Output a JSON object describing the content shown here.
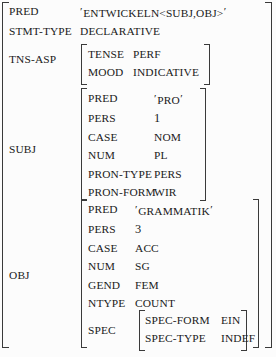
{
  "diagram": {
    "type": "lfg-f-structure",
    "title": "",
    "root": {
      "attributes": [
        {
          "attr": "PRED",
          "value": "ENTWICKELN<SUBJ,OBJ>",
          "quoted": true
        },
        {
          "attr": "STMT-TYPE",
          "value": "DECLARATIVE",
          "quoted": false
        },
        {
          "attr": "TNS-ASP",
          "value": "[embedded:tns-asp]",
          "quoted": false
        },
        {
          "attr": "SUBJ",
          "value": "[embedded:subj]",
          "quoted": false
        },
        {
          "attr": "OBJ",
          "value": "[embedded:obj]",
          "quoted": false
        }
      ]
    },
    "tns_asp": {
      "label": "TNS-ASP",
      "attributes": [
        {
          "attr": "TENSE",
          "value": "PERF"
        },
        {
          "attr": "MOOD",
          "value": "INDICATIVE"
        }
      ]
    },
    "subj": {
      "label": "SUBJ",
      "attributes": [
        {
          "attr": "PRED",
          "value": "PRO",
          "quoted": true
        },
        {
          "attr": "PERS",
          "value": "1",
          "quoted": false
        },
        {
          "attr": "CASE",
          "value": "NOM",
          "quoted": false
        },
        {
          "attr": "NUM",
          "value": "PL",
          "quoted": false
        },
        {
          "attr": "PRON-TYPE",
          "value": "PERS",
          "quoted": false
        },
        {
          "attr": "PRON-FORM",
          "value": "WIR",
          "quoted": false
        }
      ]
    },
    "obj": {
      "label": "OBJ",
      "attributes": [
        {
          "attr": "PRED",
          "value": "GRAMMATIK",
          "quoted": true
        },
        {
          "attr": "PERS",
          "value": "3",
          "quoted": false
        },
        {
          "attr": "CASE",
          "value": "ACC",
          "quoted": false
        },
        {
          "attr": "NUM",
          "value": "SG",
          "quoted": false
        },
        {
          "attr": "GEND",
          "value": "FEM",
          "quoted": false
        },
        {
          "attr": "NTYPE",
          "value": "COUNT",
          "quoted": false
        },
        {
          "attr": "SPEC",
          "value": "[embedded:spec]",
          "quoted": false
        }
      ]
    },
    "spec": {
      "label": "SPEC",
      "attributes": [
        {
          "attr": "SPEC-FORM",
          "value": "EIN"
        },
        {
          "attr": "SPEC-TYPE",
          "value": "INDEF"
        }
      ]
    },
    "quote_char": "′",
    "colors": {
      "text": "#1a1a1a",
      "bracket": "#3a3a3a",
      "background": "#fcfcfc"
    }
  }
}
